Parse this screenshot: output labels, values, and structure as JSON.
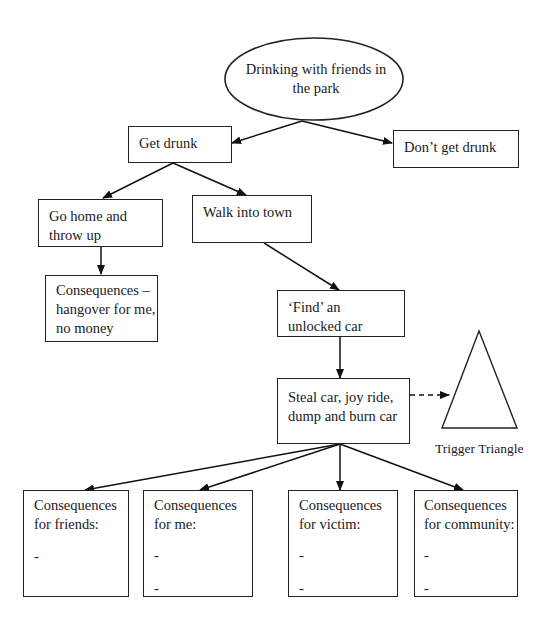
{
  "start": {
    "line1": "Drinking with friends in",
    "line2": "the park"
  },
  "nodes": {
    "get_drunk": {
      "line1": "Get drunk"
    },
    "dont_get_drunk": {
      "line1": "Don’t get drunk"
    },
    "go_home": {
      "line1": "Go home and",
      "line2": "throw up"
    },
    "walk_town": {
      "line1": "Walk into town"
    },
    "consequences_home": {
      "line1": "Consequences –",
      "line2": "hangover for me,",
      "line3": "no money"
    },
    "find_car": {
      "line1": "‘Find’ an",
      "line2": "unlocked car"
    },
    "steal_car": {
      "line1": "Steal car, joy ride,",
      "line2": "dump and burn car"
    }
  },
  "consequences": [
    {
      "line1": "Consequences",
      "line2": "for friends:",
      "bullets": [
        "-"
      ]
    },
    {
      "line1": "Consequences",
      "line2": "for me:",
      "bullets": [
        "-",
        "-"
      ]
    },
    {
      "line1": "Consequences",
      "line2": "for victim:",
      "bullets": [
        "-",
        "-"
      ]
    },
    {
      "line1": "Consequences",
      "line2": "for community:",
      "bullets": [
        "-",
        "-"
      ]
    }
  ],
  "trigger": {
    "label": "Trigger Triangle",
    "icon": "triangle-shape"
  },
  "colors": {
    "stroke": "#222222",
    "background": "#ffffff"
  }
}
